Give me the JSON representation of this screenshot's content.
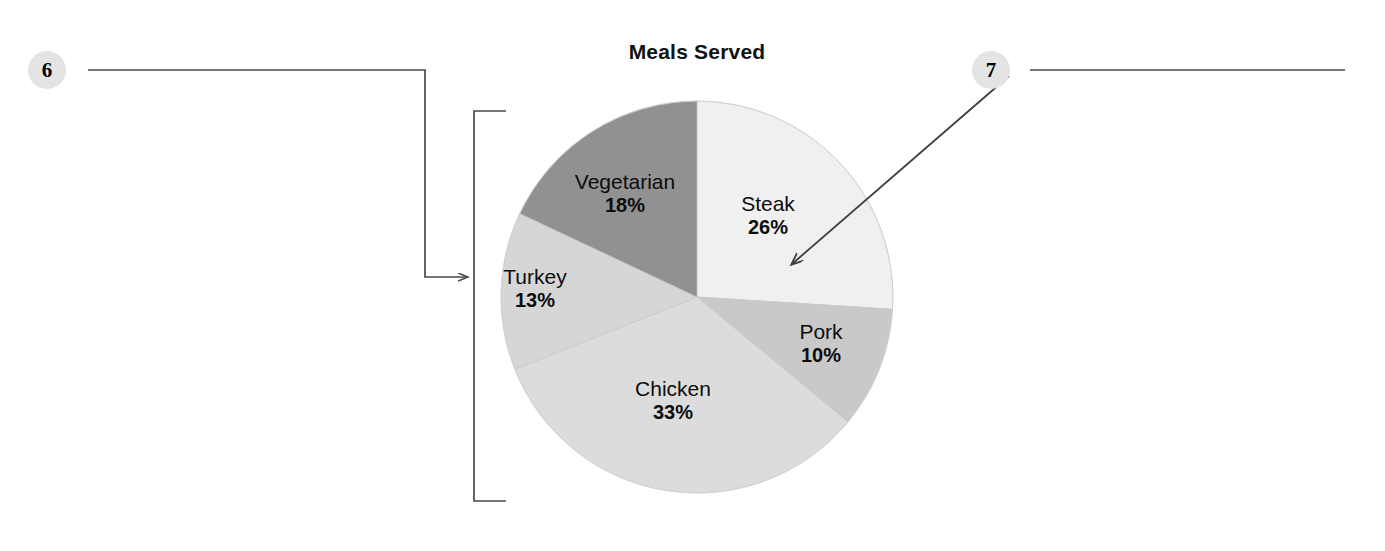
{
  "figure": {
    "background": "#ffffff",
    "line_color": "#4a4a4a"
  },
  "chart_data": {
    "type": "pie",
    "title": "Meals Served",
    "categories": [
      "Steak",
      "Pork",
      "Chicken",
      "Turkey",
      "Vegetarian"
    ],
    "values": [
      26,
      10,
      33,
      13,
      18
    ],
    "value_labels": [
      "26%",
      "10%",
      "33%",
      "13%",
      "18%"
    ],
    "unit": "percent",
    "start_angle_deg": 0,
    "direction": "clockwise",
    "legend": "none",
    "grid": false,
    "labels_inside": true,
    "colors": [
      "#f0f0f0",
      "#c9c9c9",
      "#dcdcdc",
      "#d6d6d6",
      "#919191"
    ],
    "slices": [
      {
        "label": "Steak",
        "value": 26,
        "value_label": "26%",
        "color": "#f0f0f0"
      },
      {
        "label": "Pork",
        "value": 10,
        "value_label": "10%",
        "color": "#c9c9c9"
      },
      {
        "label": "Chicken",
        "value": 33,
        "value_label": "33%",
        "color": "#dcdcdc"
      },
      {
        "label": "Turkey",
        "value": 13,
        "value_label": "13%",
        "color": "#d6d6d6"
      },
      {
        "label": "Vegetarian",
        "value": 18,
        "value_label": "18%",
        "color": "#919191"
      }
    ]
  },
  "annotations": {
    "callouts": [
      {
        "id": "6",
        "label": "6",
        "points_to": "chart-area-bracket"
      },
      {
        "id": "7",
        "label": "7",
        "points_to": "steak-slice"
      }
    ]
  }
}
